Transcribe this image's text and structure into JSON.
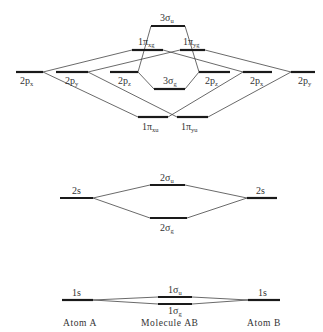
{
  "columns": {
    "left": "Atom A",
    "center": "Molecule AB",
    "right": "Atom B"
  },
  "levels": {
    "a_2px": {
      "main": "2p",
      "sub": "x"
    },
    "a_2py": {
      "main": "2p",
      "sub": "y"
    },
    "a_2pz": {
      "main": "2p",
      "sub": "z"
    },
    "b_2pz": {
      "main": "2p",
      "sub": "z"
    },
    "b_2px": {
      "main": "2p",
      "sub": "x"
    },
    "b_2py": {
      "main": "2p",
      "sub": "y"
    },
    "m_3su": {
      "main": "3σ",
      "sub": "u"
    },
    "m_1pxg": {
      "main": "1π",
      "sub": "xg"
    },
    "m_1pyg": {
      "main": "1π",
      "sub": "yg"
    },
    "m_3sg": {
      "main": "3σ",
      "sub": "g"
    },
    "m_1pxu": {
      "main": "1π",
      "sub": "xu"
    },
    "m_1pyu": {
      "main": "1π",
      "sub": "yu"
    },
    "a_2s": {
      "main": "2s",
      "sub": ""
    },
    "b_2s": {
      "main": "2s",
      "sub": ""
    },
    "m_2su": {
      "main": "2σ",
      "sub": "u"
    },
    "m_2sg": {
      "main": "2σ",
      "sub": "g"
    },
    "a_1s": {
      "main": "1s",
      "sub": ""
    },
    "b_1s": {
      "main": "1s",
      "sub": ""
    },
    "m_1su": {
      "main": "1σ",
      "sub": "u"
    },
    "m_1sg": {
      "main": "1σ",
      "sub": "g"
    }
  }
}
